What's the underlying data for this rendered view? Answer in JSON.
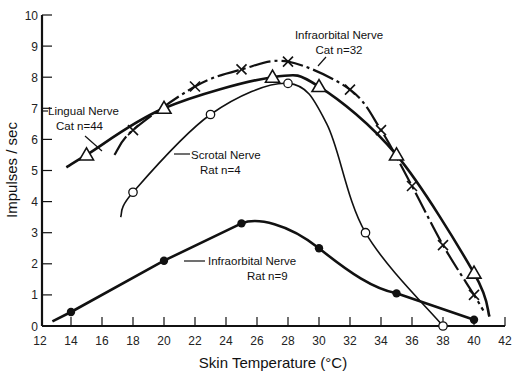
{
  "chart_data": {
    "type": "line",
    "title": "",
    "xlabel": "Skin Temperature (°C)",
    "ylabel": "Impulses / sec",
    "xlim": [
      12,
      42
    ],
    "ylim": [
      0,
      10
    ],
    "x_ticks": [
      "12",
      "14",
      "16",
      "18",
      "20",
      "22",
      "24",
      "26",
      "28",
      "30",
      "32",
      "34",
      "36",
      "38",
      "40",
      "42"
    ],
    "y_ticks": [
      "0",
      "1",
      "2",
      "3",
      "4",
      "5",
      "6",
      "7",
      "8",
      "9",
      "10"
    ],
    "grid": false,
    "legend": "inline labels",
    "series": [
      {
        "name": "Infraorbital Nerve Cat n=32",
        "label_line1": "Infraorbital   Nerve",
        "label_line2": "Cat  n=32",
        "marker": "x",
        "line_style": "dash-dot",
        "x": [
          18,
          22,
          25,
          28,
          32,
          34,
          36,
          38,
          40
        ],
        "y": [
          6.3,
          7.7,
          8.25,
          8.5,
          7.6,
          6.3,
          4.5,
          2.6,
          1.0
        ]
      },
      {
        "name": "Lingual Nerve Cat n=44",
        "label_line1": "Lingual Nerve",
        "label_line2": "Cat  n=44",
        "marker": "triangle",
        "line_style": "solid-thick",
        "x": [
          15,
          20,
          27,
          30,
          35,
          40
        ],
        "y": [
          5.5,
          7.0,
          8.0,
          7.7,
          5.5,
          1.7
        ]
      },
      {
        "name": "Scrotal Nerve Rat n=4",
        "label_line1": "Scrotal Nerve",
        "label_line2": "Rat  n=4",
        "marker": "open-circle",
        "line_style": "solid",
        "x": [
          18,
          23,
          28,
          33,
          38
        ],
        "y": [
          4.3,
          6.8,
          7.8,
          3.0,
          0.0
        ]
      },
      {
        "name": "Infraorbital Nerve Rat n=9",
        "label_line1": "Infraorbital   Nerve",
        "label_line2": "Rat  n=9",
        "marker": "filled-circle",
        "line_style": "solid-thick",
        "x": [
          14,
          20,
          25,
          30,
          35,
          40
        ],
        "y": [
          0.45,
          2.1,
          3.3,
          2.5,
          1.05,
          0.2
        ]
      }
    ]
  }
}
